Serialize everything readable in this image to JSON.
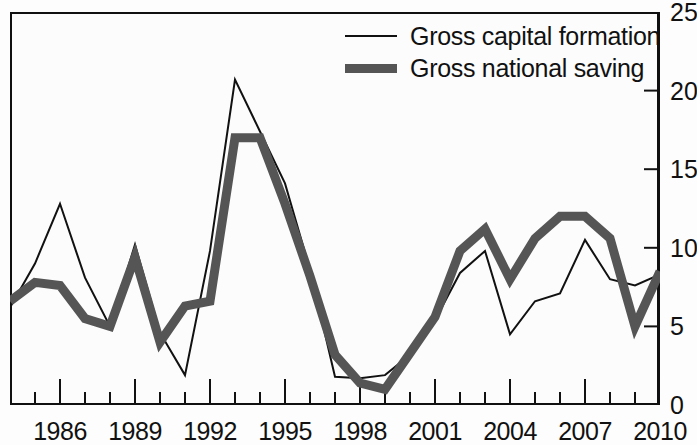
{
  "chart_data": {
    "type": "line",
    "title": "",
    "subtitle": "",
    "xlabel": "",
    "ylabel": "",
    "xlim": [
      1984,
      2010
    ],
    "ylim": [
      0,
      25
    ],
    "grid": false,
    "legend_position": "top-right",
    "y_axis_side": "right",
    "x_tick_labels": [
      "1986",
      "1989",
      "1992",
      "1995",
      "1998",
      "2001",
      "2004",
      "2007",
      "2010"
    ],
    "x_tick_values": [
      1986,
      1989,
      1992,
      1995,
      1998,
      2001,
      2004,
      2007,
      2010
    ],
    "x_minor_tick_values": [
      1984,
      1985,
      1987,
      1988,
      1990,
      1991,
      1993,
      1994,
      1996,
      1997,
      1999,
      2000,
      2002,
      2003,
      2005,
      2006,
      2008,
      2009
    ],
    "y_tick_labels": [
      "0",
      "5",
      "10",
      "15",
      "20",
      "25"
    ],
    "y_tick_values": [
      0,
      5,
      10,
      15,
      20,
      25
    ],
    "x": [
      1984,
      1985,
      1986,
      1987,
      1988,
      1989,
      1990,
      1991,
      1992,
      1993,
      1994,
      1995,
      1996,
      1997,
      1998,
      1999,
      2000,
      2001,
      2002,
      2003,
      2004,
      2005,
      2006,
      2007,
      2008,
      2009,
      2010
    ],
    "series": [
      {
        "name": "Gross capital formation",
        "style": "thin",
        "color": "#111111",
        "width": 2,
        "values": [
          6.2,
          9.0,
          12.8,
          8.1,
          5.0,
          10.2,
          4.6,
          1.9,
          9.8,
          20.7,
          17.4,
          14.1,
          8.6,
          1.8,
          1.7,
          1.9,
          3.2,
          5.4,
          8.4,
          9.8,
          4.5,
          6.6,
          7.1,
          10.5,
          8.0,
          7.6,
          8.3
        ]
      },
      {
        "name": "Gross national saving",
        "style": "thick",
        "color": "#555555",
        "width": 9,
        "values": [
          6.6,
          7.8,
          7.6,
          5.5,
          5.0,
          9.4,
          4.0,
          6.3,
          6.6,
          17.0,
          17.0,
          12.8,
          8.2,
          3.2,
          1.4,
          1.0,
          3.3,
          5.6,
          9.8,
          11.2,
          8.0,
          10.6,
          12.0,
          12.0,
          10.6,
          5.0,
          8.5
        ]
      }
    ]
  },
  "legend": {
    "items": [
      {
        "label": "Gross capital formation",
        "style": "thin"
      },
      {
        "label": "Gross national saving",
        "style": "thick"
      }
    ]
  }
}
